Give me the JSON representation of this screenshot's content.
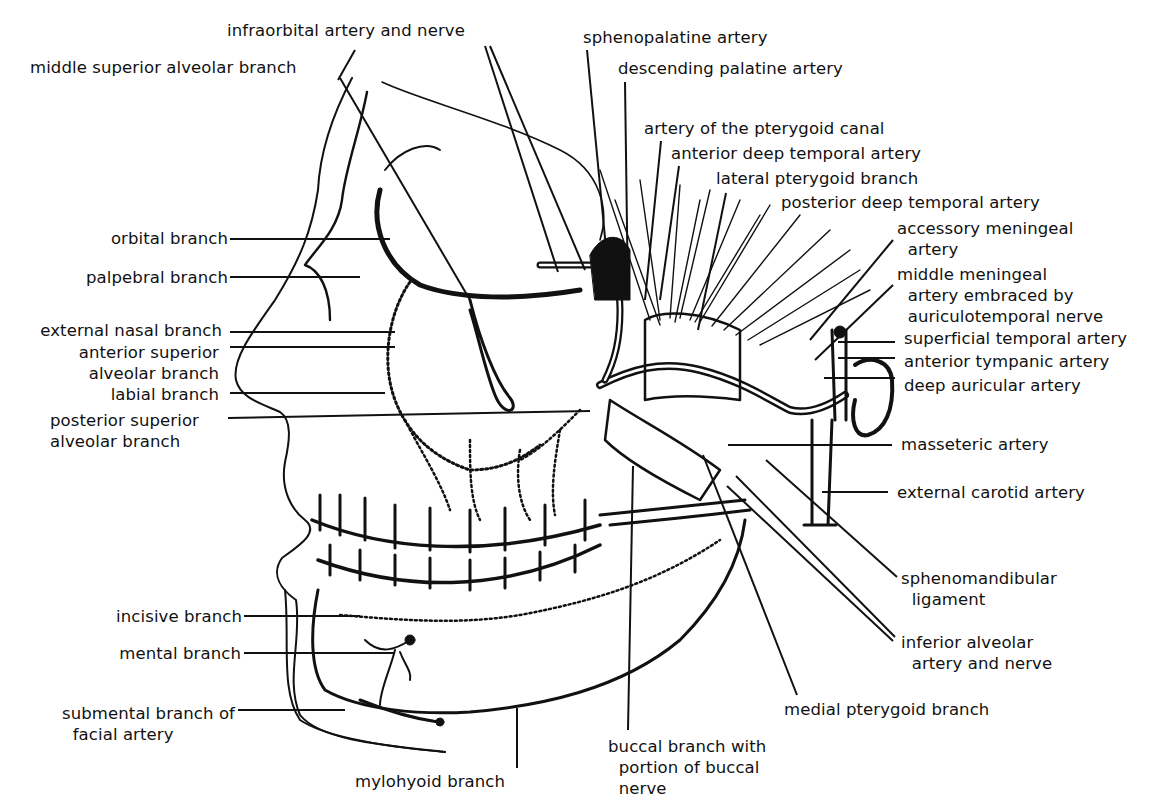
{
  "diagram": {
    "type": "anatomical line illustration",
    "colors": {
      "ink": "#111111",
      "paper": "#ffffff"
    }
  },
  "labels": [
    {
      "id": "infraorbital",
      "lines": [
        "infraorbital artery and nerve"
      ],
      "x": 227,
      "y": 20,
      "align": "left"
    },
    {
      "id": "middle-superior-alveolar",
      "lines": [
        "middle superior alveolar branch"
      ],
      "x": 30,
      "y": 57,
      "align": "left"
    },
    {
      "id": "sphenopalatine",
      "lines": [
        "sphenopalatine artery"
      ],
      "x": 583,
      "y": 27,
      "align": "left"
    },
    {
      "id": "descending-palatine",
      "lines": [
        "descending palatine artery"
      ],
      "x": 618,
      "y": 58,
      "align": "left"
    },
    {
      "id": "pterygoid-canal",
      "lines": [
        "artery of the pterygoid canal"
      ],
      "x": 644,
      "y": 118,
      "align": "left"
    },
    {
      "id": "anterior-deep-temporal",
      "lines": [
        "anterior deep temporal artery"
      ],
      "x": 671,
      "y": 143,
      "align": "left"
    },
    {
      "id": "lateral-pterygoid",
      "lines": [
        "lateral pterygoid branch"
      ],
      "x": 716,
      "y": 168,
      "align": "left"
    },
    {
      "id": "posterior-deep-temporal",
      "lines": [
        "posterior deep temporal artery"
      ],
      "x": 781,
      "y": 192,
      "align": "left"
    },
    {
      "id": "accessory-meningeal",
      "lines": [
        "accessory meningeal",
        "  artery"
      ],
      "x": 897,
      "y": 218,
      "align": "left"
    },
    {
      "id": "middle-meningeal",
      "lines": [
        "middle meningeal",
        "  artery embraced by",
        "  auriculotemporal nerve"
      ],
      "x": 897,
      "y": 264,
      "align": "left"
    },
    {
      "id": "superficial-temporal",
      "lines": [
        "superficial temporal artery"
      ],
      "x": 904,
      "y": 328,
      "align": "left"
    },
    {
      "id": "anterior-tympanic",
      "lines": [
        "anterior tympanic artery"
      ],
      "x": 904,
      "y": 351,
      "align": "left"
    },
    {
      "id": "deep-auricular",
      "lines": [
        "deep auricular artery"
      ],
      "x": 904,
      "y": 375,
      "align": "left"
    },
    {
      "id": "masseteric",
      "lines": [
        "masseteric artery"
      ],
      "x": 901,
      "y": 434,
      "align": "left"
    },
    {
      "id": "external-carotid",
      "lines": [
        "external carotid artery"
      ],
      "x": 897,
      "y": 482,
      "align": "left"
    },
    {
      "id": "sphenomandibular",
      "lines": [
        "sphenomandibular",
        "  ligament"
      ],
      "x": 901,
      "y": 568,
      "align": "left"
    },
    {
      "id": "inferior-alveolar",
      "lines": [
        "inferior alveolar",
        "  artery and nerve"
      ],
      "x": 901,
      "y": 632,
      "align": "left"
    },
    {
      "id": "medial-pterygoid",
      "lines": [
        "medial pterygoid branch"
      ],
      "x": 784,
      "y": 699,
      "align": "left"
    },
    {
      "id": "buccal",
      "lines": [
        "buccal branch with",
        "  portion of buccal",
        "  nerve"
      ],
      "x": 608,
      "y": 736,
      "align": "left"
    },
    {
      "id": "mylohyoid",
      "lines": [
        "mylohyoid branch"
      ],
      "x": 355,
      "y": 771,
      "align": "left"
    },
    {
      "id": "orbital",
      "lines": [
        "orbital branch"
      ],
      "x": 90,
      "y": 228,
      "align": "right",
      "right": 228
    },
    {
      "id": "palpebral",
      "lines": [
        "palpebral branch"
      ],
      "x": 67,
      "y": 267,
      "align": "right",
      "right": 228
    },
    {
      "id": "external-nasal",
      "lines": [
        "external nasal branch"
      ],
      "x": 20,
      "y": 320,
      "align": "right",
      "right": 222
    },
    {
      "id": "anterior-superior-alveolar",
      "lines": [
        "anterior superior",
        "alveolar branch"
      ],
      "x": 58,
      "y": 342,
      "align": "right",
      "right": 219
    },
    {
      "id": "labial",
      "lines": [
        "labial branch"
      ],
      "x": 96,
      "y": 384,
      "align": "right",
      "right": 219
    },
    {
      "id": "posterior-superior-alveolar",
      "lines": [
        "posterior superior",
        "alveolar branch"
      ],
      "x": 50,
      "y": 410,
      "align": "left"
    },
    {
      "id": "incisive",
      "lines": [
        "incisive branch"
      ],
      "x": 120,
      "y": 606,
      "align": "right",
      "right": 242
    },
    {
      "id": "mental",
      "lines": [
        "mental branch"
      ],
      "x": 122,
      "y": 643,
      "align": "right",
      "right": 241
    },
    {
      "id": "submental",
      "lines": [
        "submental branch of",
        "  facial artery"
      ],
      "x": 62,
      "y": 703,
      "align": "left"
    }
  ],
  "leaders": [
    {
      "for": "infraorbital",
      "points": [
        [
          485,
          46
        ],
        [
          558,
          272
        ]
      ]
    },
    {
      "for": "infraorbital-2",
      "points": [
        [
          490,
          46
        ],
        [
          585,
          270
        ]
      ]
    },
    {
      "for": "middle-superior-alveolar",
      "points": [
        [
          340,
          78
        ],
        [
          470,
          300
        ]
      ]
    },
    {
      "for": "middle-superior-alveolar-top",
      "points": [
        [
          355,
          50
        ],
        [
          338,
          80
        ]
      ]
    },
    {
      "for": "sphenopalatine",
      "points": [
        [
          587,
          50
        ],
        [
          610,
          290
        ]
      ]
    },
    {
      "for": "descending-palatine",
      "points": [
        [
          625,
          82
        ],
        [
          628,
          300
        ]
      ]
    },
    {
      "for": "pterygoid-canal",
      "points": [
        [
          661,
          141
        ],
        [
          645,
          300
        ]
      ]
    },
    {
      "for": "anterior-deep-temporal",
      "points": [
        [
          679,
          166
        ],
        [
          660,
          300
        ]
      ]
    },
    {
      "for": "lateral-pterygoid",
      "points": [
        [
          726,
          193
        ],
        [
          698,
          330
        ]
      ]
    },
    {
      "for": "accessory-meningeal",
      "points": [
        [
          893,
          240
        ],
        [
          810,
          340
        ]
      ]
    },
    {
      "for": "middle-meningeal",
      "points": [
        [
          893,
          285
        ],
        [
          815,
          360
        ]
      ]
    },
    {
      "for": "superficial-temporal",
      "points": [
        [
          838,
          342
        ],
        [
          895,
          342
        ]
      ]
    },
    {
      "for": "anterior-tympanic",
      "points": [
        [
          838,
          358
        ],
        [
          895,
          358
        ]
      ]
    },
    {
      "for": "deep-auricular",
      "points": [
        [
          824,
          378
        ],
        [
          895,
          378
        ]
      ]
    },
    {
      "for": "masseteric",
      "points": [
        [
          728,
          445
        ],
        [
          892,
          445
        ]
      ]
    },
    {
      "for": "external-carotid",
      "points": [
        [
          822,
          492
        ],
        [
          888,
          492
        ]
      ]
    },
    {
      "for": "sphenomandibular",
      "points": [
        [
          766,
          460
        ],
        [
          897,
          577
        ]
      ]
    },
    {
      "for": "inferior-alveolar",
      "points": [
        [
          736,
          476
        ],
        [
          895,
          637
        ]
      ]
    },
    {
      "for": "inferior-alveolar-2",
      "points": [
        [
          727,
          486
        ],
        [
          893,
          641
        ]
      ]
    },
    {
      "for": "medial-pterygoid",
      "points": [
        [
          703,
          455
        ],
        [
          797,
          695
        ]
      ]
    },
    {
      "for": "buccal",
      "points": [
        [
          633,
          466
        ],
        [
          628,
          730
        ]
      ]
    },
    {
      "for": "mylohyoid",
      "points": [
        [
          517,
          708
        ],
        [
          517,
          768
        ]
      ]
    },
    {
      "for": "orbital",
      "points": [
        [
          230,
          239
        ],
        [
          390,
          239
        ]
      ]
    },
    {
      "for": "palpebral",
      "points": [
        [
          230,
          277
        ],
        [
          360,
          277
        ]
      ]
    },
    {
      "for": "external-nasal",
      "points": [
        [
          230,
          332
        ],
        [
          395,
          332
        ]
      ]
    },
    {
      "for": "anterior-superior-alveolar",
      "points": [
        [
          230,
          347
        ],
        [
          395,
          347
        ]
      ]
    },
    {
      "for": "labial",
      "points": [
        [
          230,
          393
        ],
        [
          385,
          393
        ]
      ]
    },
    {
      "for": "posterior-superior-alveolar",
      "points": [
        [
          228,
          418
        ],
        [
          590,
          411
        ]
      ]
    },
    {
      "for": "incisive",
      "points": [
        [
          244,
          616
        ],
        [
          360,
          616
        ]
      ]
    },
    {
      "for": "mental",
      "points": [
        [
          244,
          653
        ],
        [
          395,
          653
        ]
      ]
    },
    {
      "for": "submental",
      "points": [
        [
          238,
          710
        ],
        [
          345,
          710
        ]
      ]
    }
  ]
}
